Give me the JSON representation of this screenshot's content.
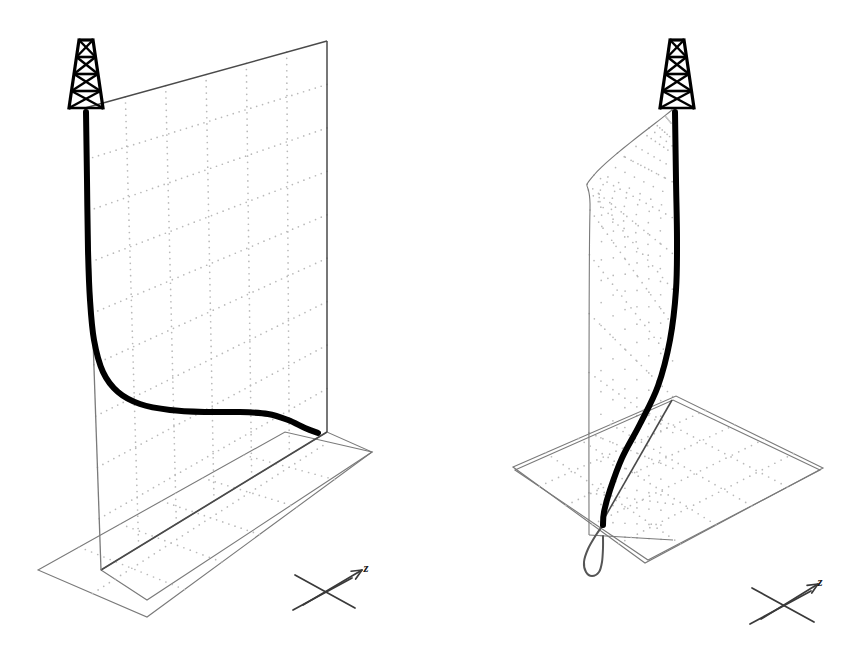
{
  "figure": {
    "title": "",
    "background_color": "#ffffff",
    "panel_count": 2
  },
  "colors": {
    "curve": "#000000",
    "plane_edge": "#7a7a7a",
    "plane_edge_dark": "#4a4a4a",
    "grid_dot": "#b9b9b9",
    "grid_dot_dark": "#a0a0a0",
    "derrick": "#000000",
    "axis": "#3a3a3a",
    "background": "#ffffff"
  },
  "panels": [
    {
      "id": "left-panel",
      "name": "flat-vertical-plane-panel",
      "description": "Derrick on top of a flat vertical grid plane with an S-shaped profile curve descending from the rig and flattening along the bottom.",
      "derrick": {
        "name": "derrick-tower",
        "apex_x": 86,
        "apex_y": 40,
        "base_y": 108,
        "half_width_top": 7,
        "half_width_bottom": 17,
        "tiers": 4
      },
      "vertical_plane": {
        "name": "vertical-grid-plane",
        "corners": [
          [
            85,
            108
          ],
          [
            327,
            41
          ],
          [
            327,
            432
          ],
          [
            101,
            570
          ]
        ],
        "grid_cols": 6,
        "grid_rows": 9
      },
      "ground_plane": {
        "name": "ground-grid-plane",
        "corners": [
          [
            101,
            570
          ],
          [
            327,
            432
          ],
          [
            372,
            452
          ],
          [
            147,
            600
          ]
        ],
        "outer_corners": [
          [
            38,
            570
          ],
          [
            285,
            432
          ],
          [
            372,
            452
          ],
          [
            147,
            617
          ]
        ],
        "grid_cols": 6,
        "grid_rows": 2
      },
      "curve": {
        "name": "profile-curve",
        "stroke_width": 6,
        "points": [
          [
            86,
            112
          ],
          [
            87,
            180
          ],
          [
            88,
            250
          ],
          [
            90,
            300
          ],
          [
            94,
            340
          ],
          [
            103,
            372
          ],
          [
            118,
            392
          ],
          [
            140,
            404
          ],
          [
            170,
            410
          ],
          [
            205,
            412
          ],
          [
            240,
            412
          ],
          [
            268,
            414
          ],
          [
            288,
            420
          ],
          [
            305,
            428
          ],
          [
            318,
            433
          ]
        ]
      },
      "axis_indicator": {
        "name": "axis-indicator",
        "label": "z",
        "label_x": 366,
        "label_y": 572,
        "center": [
          325,
          592
        ],
        "cross_arm_1": [
          [
            295,
            575
          ],
          [
            355,
            608
          ]
        ],
        "cross_arm_2": [
          [
            293,
            610
          ],
          [
            352,
            578
          ]
        ],
        "arrow_from": [
          303,
          605
        ],
        "arrow_to": [
          362,
          570
        ]
      }
    },
    {
      "id": "right-panel",
      "name": "warped-surface-panel",
      "description": "Derrick on top of a warped ruled surface that bulges outward, with a bowed thick curve descending through a tilted ground grid plane.",
      "derrick": {
        "name": "derrick-tower",
        "apex_x": 677,
        "apex_y": 40,
        "base_y": 108,
        "half_width_top": 7,
        "half_width_bottom": 17,
        "tiers": 4
      },
      "warped_surface": {
        "name": "warped-grid-surface",
        "top_point": [
          672,
          110
        ],
        "left_bulge": [
          594,
          175
        ],
        "left_fold": [
          590,
          210
        ],
        "left_bottom": [
          589,
          535
        ],
        "right_bottom": [
          673,
          540
        ],
        "ruling_count": 7
      },
      "ground_plane": {
        "name": "ground-grid-plane",
        "corners": [
          [
            515,
            470
          ],
          [
            673,
            400
          ],
          [
            820,
            470
          ],
          [
            648,
            560
          ]
        ],
        "outer_corners": [
          [
            513,
            467
          ],
          [
            676,
            396
          ],
          [
            823,
            468
          ],
          [
            645,
            563
          ]
        ],
        "grid_cols": 5,
        "grid_rows": 5
      },
      "curve": {
        "name": "profile-curve",
        "stroke_width": 6,
        "points": [
          [
            675,
            112
          ],
          [
            676,
            180
          ],
          [
            677,
            240
          ],
          [
            676,
            290
          ],
          [
            670,
            340
          ],
          [
            658,
            386
          ],
          [
            640,
            424
          ],
          [
            622,
            458
          ],
          [
            610,
            490
          ],
          [
            604,
            512
          ],
          [
            603,
            525
          ]
        ]
      },
      "projection_curve": {
        "name": "ground-projection-curve",
        "stroke_width": 2,
        "points": [
          [
            603,
            525
          ],
          [
            596,
            535
          ],
          [
            588,
            549
          ],
          [
            584,
            562
          ],
          [
            586,
            572
          ],
          [
            592,
            576
          ],
          [
            599,
            572
          ],
          [
            602,
            562
          ],
          [
            603,
            548
          ],
          [
            603,
            536
          ]
        ]
      },
      "diagonal_line": {
        "name": "surface-base-diagonal",
        "from": [
          672,
          400
        ],
        "to": [
          601,
          524
        ]
      },
      "axis_indicator": {
        "name": "axis-indicator",
        "label": "z",
        "label_x": 820,
        "label_y": 586,
        "center": [
          784,
          605
        ],
        "cross_arm_1": [
          [
            752,
            588
          ],
          [
            814,
            622
          ]
        ],
        "cross_arm_2": [
          [
            750,
            624
          ],
          [
            811,
            591
          ]
        ],
        "arrow_from": [
          761,
          619
        ],
        "arrow_to": [
          818,
          584
        ]
      }
    }
  ]
}
